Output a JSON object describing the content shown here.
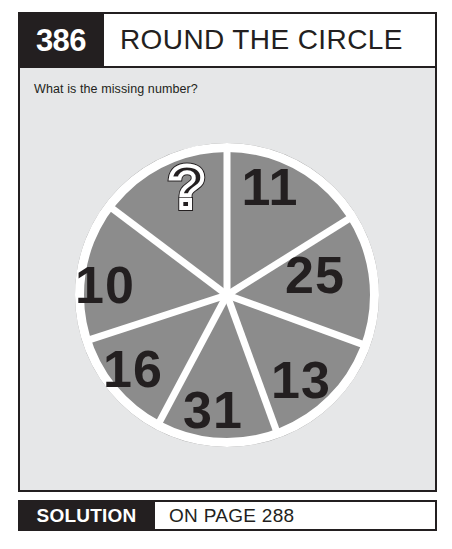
{
  "header": {
    "number": "386",
    "title": "ROUND THE CIRCLE"
  },
  "body": {
    "question": "What is the missing number?"
  },
  "footer": {
    "solution_label": "SOLUTION",
    "solution_page": "ON PAGE 288"
  },
  "colors": {
    "ink": "#231f20",
    "panel_bg": "#e6e7e8",
    "circle_fill": "#8c8c8c",
    "divider": "#ffffff",
    "page_bg": "#ffffff"
  },
  "chart_data": {
    "type": "pie",
    "title": "Round the circle",
    "xlabel": "",
    "ylabel": "",
    "legend": "none",
    "grid": false,
    "center": [
      162,
      162
    ],
    "radius": 152,
    "ring_width": 9,
    "note": "Seven equal-looking wedges of a circle, each labelled with a number; one wedge is unknown.",
    "categories": [
      "?",
      "11",
      "25",
      "13",
      "31",
      "16",
      "10"
    ],
    "values": [
      null,
      11,
      25,
      13,
      31,
      16,
      10
    ],
    "segments": [
      {
        "label": "?",
        "value": null,
        "start_angle": -53,
        "end_angle": 0,
        "label_x": 122,
        "label_y": 75,
        "is_missing": true
      },
      {
        "label": "11",
        "value": 11,
        "start_angle": 0,
        "end_angle": 58,
        "label_x": 205,
        "label_y": 72,
        "is_missing": false
      },
      {
        "label": "25",
        "value": 25,
        "start_angle": 58,
        "end_angle": 110,
        "label_x": 250,
        "label_y": 160,
        "is_missing": false
      },
      {
        "label": "13",
        "value": 13,
        "start_angle": 110,
        "end_angle": 160,
        "label_x": 236,
        "label_y": 265,
        "is_missing": false
      },
      {
        "label": "31",
        "value": 31,
        "start_angle": 160,
        "end_angle": 208,
        "label_x": 148,
        "label_y": 295,
        "is_missing": false
      },
      {
        "label": "16",
        "value": 16,
        "start_angle": 208,
        "end_angle": 252,
        "label_x": 68,
        "label_y": 254,
        "is_missing": false
      },
      {
        "label": "10",
        "value": 10,
        "start_angle": 252,
        "end_angle": 307,
        "label_x": 40,
        "label_y": 170,
        "is_missing": false
      }
    ]
  }
}
